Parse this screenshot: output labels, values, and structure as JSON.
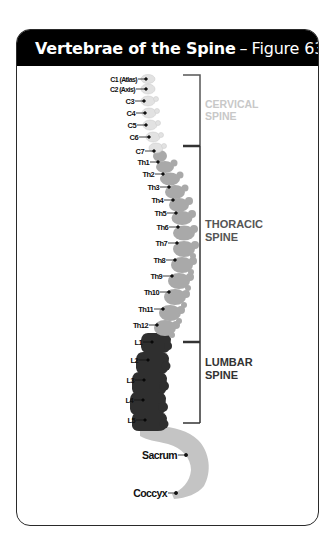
{
  "header": {
    "title": "Vertebrae of the Spine",
    "separator": "–",
    "figure": "Figure 63"
  },
  "colors": {
    "header_bg": "#000000",
    "cervical": "#e2e2e2",
    "thoracic": "#a9a9a9",
    "lumbar": "#2f2f2f",
    "sacrum": "#c4c4c4",
    "bracket": "#333333",
    "cervical_text": "#c8c8c8",
    "region_text": "#555555"
  },
  "regions": {
    "cervical": {
      "line1": "CERVICAL",
      "line2": "SPINE"
    },
    "thoracic": {
      "line1": "THORACIC",
      "line2": "SPINE"
    },
    "lumbar": {
      "line1": "LUMBAR",
      "line2": "SPINE"
    }
  },
  "vertebrae": {
    "c1": "C1 (Atlas)",
    "c2": "C2 (Axis)",
    "c3": "C3",
    "c4": "C4",
    "c5": "C5",
    "c6": "C6",
    "c7": "C7",
    "th1": "Th1",
    "th2": "Th2",
    "th3": "Th3",
    "th4": "Th4",
    "th5": "Th5",
    "th6": "Th6",
    "th7": "Th7",
    "th8": "Th8",
    "th9": "Th9",
    "th10": "Th10",
    "th11": "Th11",
    "th12": "Th12",
    "l1": "L1",
    "l2": "L2",
    "l3": "L3",
    "l4": "L4",
    "l5": "L5",
    "sacrum": "Sacrum",
    "coccyx": "Coccyx"
  }
}
